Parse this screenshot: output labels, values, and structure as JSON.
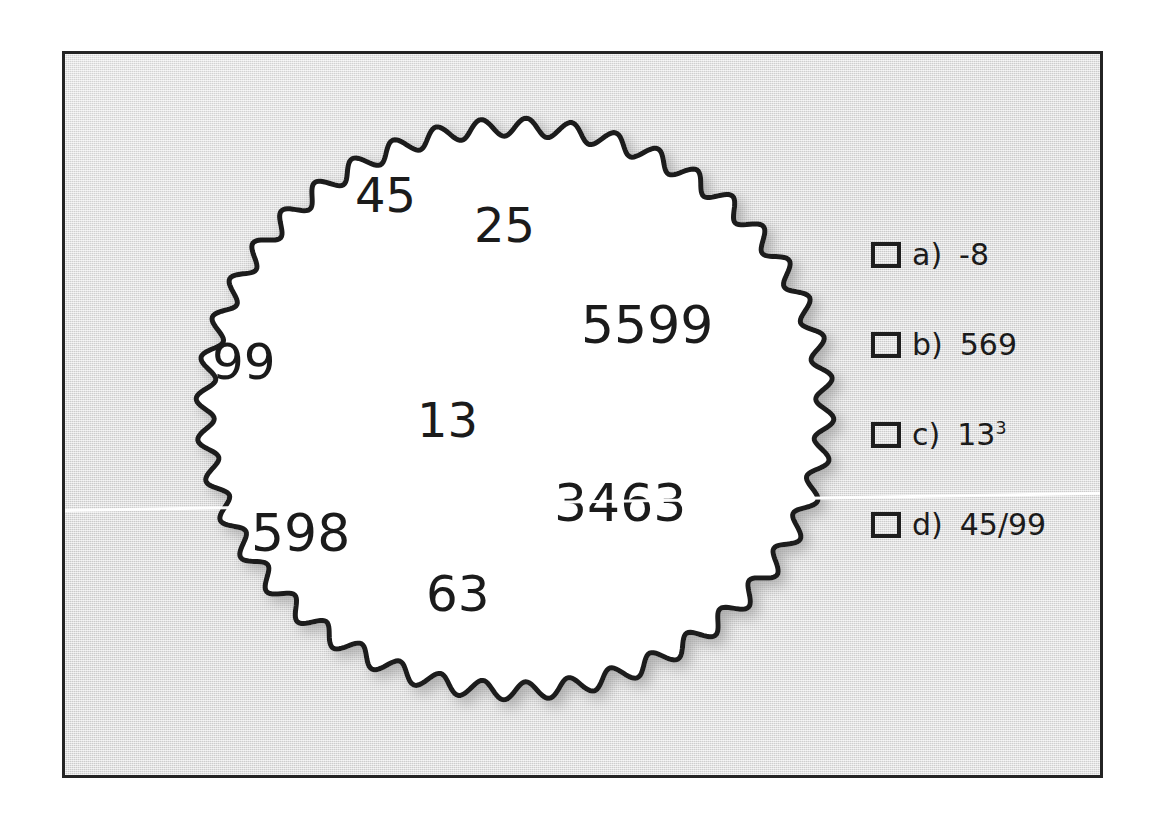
{
  "worksheet": {
    "frame": {
      "background_color": "#dcdcdc",
      "border_color": "#242424"
    },
    "circle": {
      "shape_name": "scalloped-circle",
      "fill_color": "#ffffff",
      "outline_color": "#1a1a1a",
      "scallop_count": 44
    },
    "numbers": [
      {
        "value": "45",
        "x": 352,
        "y": 168,
        "size": 48
      },
      {
        "value": "25",
        "x": 471,
        "y": 198,
        "size": 48
      },
      {
        "value": "5599",
        "x": 578,
        "y": 296,
        "size": 52
      },
      {
        "value": "99",
        "x": 209,
        "y": 334,
        "size": 50
      },
      {
        "value": "13",
        "x": 414,
        "y": 393,
        "size": 48
      },
      {
        "value": "3463",
        "x": 551,
        "y": 474,
        "size": 52
      },
      {
        "value": "598",
        "x": 248,
        "y": 504,
        "size": 52
      },
      {
        "value": "63",
        "x": 423,
        "y": 566,
        "size": 50
      }
    ],
    "answer_options": [
      {
        "letter": "a)",
        "value": "-8",
        "superscript": "",
        "checked": false
      },
      {
        "letter": "b)",
        "value": "569",
        "superscript": "",
        "checked": false
      },
      {
        "letter": "c)",
        "value": "13",
        "superscript": "3",
        "checked": false
      },
      {
        "letter": "d)",
        "value": "45/99",
        "superscript": "",
        "checked": false
      }
    ],
    "artifacts": {
      "scan_streak": "white-diagonal-scan-line"
    }
  }
}
